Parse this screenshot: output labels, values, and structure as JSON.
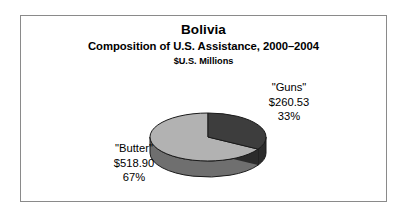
{
  "chart_data": {
    "type": "pie",
    "title": "Bolivia",
    "subtitle": "Composition of U.S. Assistance, 2000–2004",
    "units": "$U.S. Millions",
    "xlabel": "",
    "ylabel": "",
    "legend_position": "none",
    "grid": false,
    "three_d": true,
    "categories": [
      "\"Guns\"",
      "\"Butter\""
    ],
    "values": [
      260.53,
      518.9
    ],
    "value_labels": [
      "$260.53",
      "$518.90"
    ],
    "percent_labels": [
      "33%",
      "67%"
    ],
    "percents": [
      33,
      67
    ],
    "slices": [
      {
        "name": "\"Guns\"",
        "value": 260.53,
        "value_label": "$260.53",
        "percent": 33,
        "percent_label": "33%",
        "color": "#3d3d3d",
        "side_color": "#2b2b2b"
      },
      {
        "name": "\"Butter\"",
        "value": 518.9,
        "value_label": "$518.90",
        "percent": 67,
        "percent_label": "67%",
        "color": "#b2b2b2",
        "side_color": "#6f6f6f"
      }
    ]
  },
  "chart": {
    "title": "Bolivia",
    "subtitle": "Composition of U.S. Assistance, 2000–2004",
    "units": "$U.S. Millions"
  },
  "labels": {
    "guns": {
      "name": "\"Guns\"",
      "value": "$260.53",
      "percent": "33%"
    },
    "butter": {
      "name": "\"Butter\"",
      "value": "$518.90",
      "percent": "67%"
    }
  },
  "colors": {
    "frame_border": "#8a8a8a",
    "background": "#ffffff",
    "text": "#000000",
    "guns_top": "#3d3d3d",
    "guns_side": "#2b2b2b",
    "butter_top": "#b2b2b2",
    "butter_side": "#6f6f6f",
    "slice_outline": "#1a1a1a"
  }
}
